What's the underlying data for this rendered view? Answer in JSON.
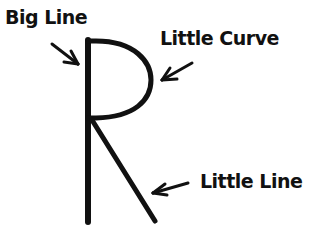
{
  "diagram": {
    "letter": "R",
    "labels": {
      "big_line": "Big Line",
      "little_curve": "Little Curve",
      "little_line": "Little Line"
    },
    "colors": {
      "ink": "#111111",
      "background": "#ffffff"
    }
  }
}
